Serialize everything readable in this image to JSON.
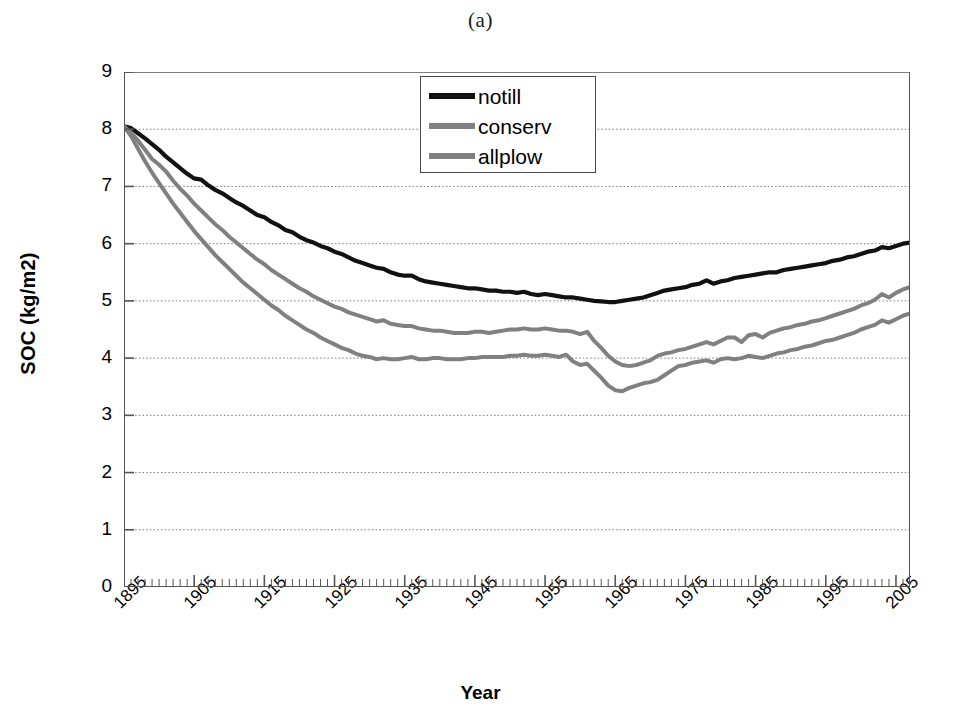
{
  "panel": {
    "title": "(a)"
  },
  "axes": {
    "ylabel": "SOC (kg/m2)",
    "xlabel": "Year",
    "yticks": [
      "0",
      "1",
      "2",
      "3",
      "4",
      "5",
      "6",
      "7",
      "8",
      "9"
    ],
    "xticks": [
      "1895",
      "1905",
      "1915",
      "1925",
      "1935",
      "1945",
      "1955",
      "1965",
      "1975",
      "1985",
      "1995",
      "2005"
    ]
  },
  "legend": {
    "items": [
      {
        "label": "notill",
        "color": "#111111"
      },
      {
        "label": "conserv",
        "color": "#808080"
      },
      {
        "label": "allplow",
        "color": "#808080"
      }
    ]
  },
  "chart_data": {
    "type": "line",
    "title": "(a)",
    "xlabel": "Year",
    "ylabel": "SOC (kg/m2)",
    "xlim": [
      1895,
      2007
    ],
    "ylim": [
      0,
      9
    ],
    "ytick_step": 1,
    "xtick_step": 10,
    "grid": "horizontal-dotted",
    "legend_position": "top-center",
    "x": [
      1895,
      1896,
      1897,
      1898,
      1899,
      1900,
      1901,
      1902,
      1903,
      1904,
      1905,
      1906,
      1907,
      1908,
      1909,
      1910,
      1911,
      1912,
      1913,
      1914,
      1915,
      1916,
      1917,
      1918,
      1919,
      1920,
      1921,
      1922,
      1923,
      1924,
      1925,
      1926,
      1927,
      1928,
      1929,
      1930,
      1931,
      1932,
      1933,
      1934,
      1935,
      1936,
      1937,
      1938,
      1939,
      1940,
      1941,
      1942,
      1943,
      1944,
      1945,
      1946,
      1947,
      1948,
      1949,
      1950,
      1951,
      1952,
      1953,
      1954,
      1955,
      1956,
      1957,
      1958,
      1959,
      1960,
      1961,
      1962,
      1963,
      1964,
      1965,
      1966,
      1967,
      1968,
      1969,
      1970,
      1971,
      1972,
      1973,
      1974,
      1975,
      1976,
      1977,
      1978,
      1979,
      1980,
      1981,
      1982,
      1983,
      1984,
      1985,
      1986,
      1987,
      1988,
      1989,
      1990,
      1991,
      1992,
      1993,
      1994,
      1995,
      1996,
      1997,
      1998,
      1999,
      2000,
      2001,
      2002,
      2003,
      2004,
      2005,
      2006,
      2007
    ],
    "series": [
      {
        "name": "notill",
        "color": "#111111",
        "values": [
          8.05,
          8.02,
          7.93,
          7.84,
          7.74,
          7.64,
          7.52,
          7.42,
          7.32,
          7.22,
          7.14,
          7.12,
          7.02,
          6.94,
          6.88,
          6.8,
          6.72,
          6.66,
          6.58,
          6.5,
          6.46,
          6.38,
          6.32,
          6.24,
          6.2,
          6.12,
          6.06,
          6.02,
          5.96,
          5.92,
          5.86,
          5.82,
          5.76,
          5.7,
          5.66,
          5.62,
          5.58,
          5.56,
          5.5,
          5.46,
          5.44,
          5.44,
          5.38,
          5.34,
          5.32,
          5.3,
          5.28,
          5.26,
          5.24,
          5.22,
          5.22,
          5.2,
          5.18,
          5.18,
          5.16,
          5.16,
          5.14,
          5.16,
          5.12,
          5.1,
          5.12,
          5.1,
          5.08,
          5.06,
          5.06,
          5.04,
          5.02,
          5.0,
          4.99,
          4.98,
          4.98,
          5.0,
          5.02,
          5.04,
          5.06,
          5.1,
          5.14,
          5.18,
          5.2,
          5.22,
          5.24,
          5.28,
          5.3,
          5.36,
          5.3,
          5.34,
          5.36,
          5.4,
          5.42,
          5.44,
          5.46,
          5.48,
          5.5,
          5.5,
          5.54,
          5.56,
          5.58,
          5.6,
          5.62,
          5.64,
          5.66,
          5.7,
          5.72,
          5.76,
          5.78,
          5.82,
          5.86,
          5.88,
          5.94,
          5.92,
          5.96,
          6.0,
          6.02
        ]
      },
      {
        "name": "conserv",
        "color": "#808080",
        "values": [
          8.05,
          7.94,
          7.8,
          7.64,
          7.48,
          7.38,
          7.26,
          7.1,
          6.96,
          6.84,
          6.7,
          6.58,
          6.46,
          6.34,
          6.24,
          6.12,
          6.02,
          5.92,
          5.82,
          5.72,
          5.64,
          5.54,
          5.46,
          5.38,
          5.3,
          5.22,
          5.16,
          5.08,
          5.02,
          4.96,
          4.9,
          4.86,
          4.8,
          4.76,
          4.72,
          4.68,
          4.64,
          4.66,
          4.6,
          4.58,
          4.56,
          4.56,
          4.52,
          4.5,
          4.48,
          4.48,
          4.46,
          4.44,
          4.44,
          4.44,
          4.46,
          4.46,
          4.44,
          4.46,
          4.48,
          4.5,
          4.5,
          4.52,
          4.5,
          4.5,
          4.52,
          4.5,
          4.48,
          4.48,
          4.46,
          4.42,
          4.46,
          4.3,
          4.18,
          4.04,
          3.94,
          3.88,
          3.86,
          3.88,
          3.92,
          3.96,
          4.04,
          4.08,
          4.1,
          4.14,
          4.16,
          4.2,
          4.24,
          4.28,
          4.24,
          4.3,
          4.36,
          4.36,
          4.28,
          4.4,
          4.42,
          4.36,
          4.44,
          4.48,
          4.52,
          4.54,
          4.58,
          4.6,
          4.64,
          4.66,
          4.7,
          4.74,
          4.78,
          4.82,
          4.86,
          4.92,
          4.96,
          5.02,
          5.12,
          5.06,
          5.14,
          5.2,
          5.24
        ]
      },
      {
        "name": "allplow",
        "color": "#808080",
        "values": [
          8.05,
          7.88,
          7.66,
          7.44,
          7.24,
          7.06,
          6.88,
          6.7,
          6.54,
          6.38,
          6.22,
          6.08,
          5.94,
          5.8,
          5.68,
          5.56,
          5.44,
          5.32,
          5.22,
          5.12,
          5.02,
          4.92,
          4.84,
          4.74,
          4.66,
          4.58,
          4.5,
          4.44,
          4.36,
          4.3,
          4.24,
          4.18,
          4.14,
          4.08,
          4.04,
          4.02,
          3.98,
          4.0,
          3.98,
          3.98,
          4.0,
          4.02,
          3.98,
          3.98,
          4.0,
          4.0,
          3.98,
          3.98,
          3.98,
          4.0,
          4.0,
          4.02,
          4.02,
          4.02,
          4.02,
          4.04,
          4.04,
          4.06,
          4.04,
          4.04,
          4.06,
          4.04,
          4.02,
          4.06,
          3.94,
          3.88,
          3.9,
          3.78,
          3.66,
          3.52,
          3.44,
          3.42,
          3.48,
          3.52,
          3.56,
          3.58,
          3.62,
          3.7,
          3.78,
          3.86,
          3.88,
          3.92,
          3.94,
          3.96,
          3.92,
          3.98,
          4.0,
          3.98,
          4.0,
          4.04,
          4.02,
          4.0,
          4.04,
          4.08,
          4.1,
          4.14,
          4.16,
          4.2,
          4.22,
          4.26,
          4.3,
          4.32,
          4.36,
          4.4,
          4.44,
          4.5,
          4.54,
          4.58,
          4.66,
          4.62,
          4.68,
          4.74,
          4.78
        ]
      }
    ]
  }
}
